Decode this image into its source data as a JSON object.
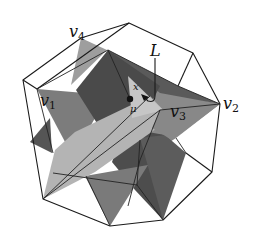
{
  "figure": {
    "labels": [
      {
        "id": "v4",
        "base": "v",
        "sub": "4"
      },
      {
        "id": "v1",
        "base": "v",
        "sub": "1"
      },
      {
        "id": "v3",
        "base": "v",
        "sub": "3"
      },
      {
        "id": "v2",
        "base": "v",
        "sub": "2"
      },
      {
        "id": "L",
        "base": "L",
        "sub": ""
      },
      {
        "id": "x",
        "base": "x",
        "sub": ""
      },
      {
        "id": "mu",
        "base": "μ",
        "sub": ""
      }
    ],
    "colors": {
      "dark": "#4a4a4a",
      "medium": "#7c7c7c",
      "light": "#b4b4b4",
      "lighter": "#c6c6c6",
      "edge": "#1a1a1a"
    }
  }
}
